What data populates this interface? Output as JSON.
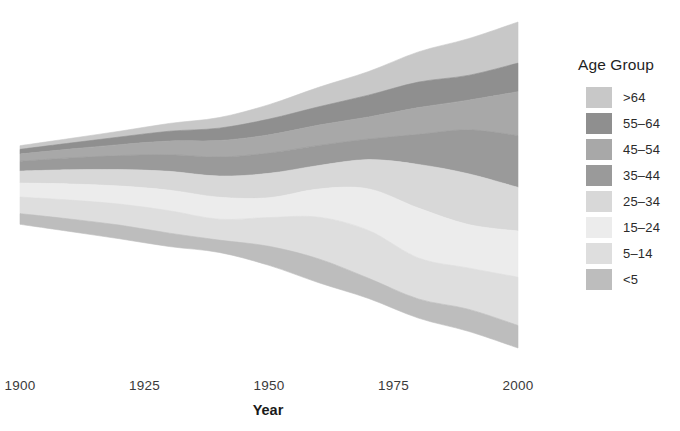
{
  "chart_data": {
    "type": "area",
    "variant": "streamgraph",
    "title": "",
    "xlabel": "Year",
    "ylabel": "",
    "xlim": [
      1900,
      2000
    ],
    "xticks": [
      1900,
      1925,
      1950,
      1975,
      2000
    ],
    "xtick_labels": [
      "1900",
      "1925",
      "1950",
      "1975",
      "2000"
    ],
    "grid": false,
    "legend_title": "Age Group",
    "legend_position": "right",
    "stack_order": "inside-out",
    "stack_offset": "wiggle",
    "x": [
      1900,
      1910,
      1920,
      1930,
      1940,
      1950,
      1960,
      1970,
      1980,
      1990,
      2000
    ],
    "series": [
      {
        "name": ">64",
        "color": "#c8c8c8",
        "values": [
          3.1,
          3.9,
          4.9,
          6.6,
          9.0,
          12.3,
          16.6,
          20.1,
          25.7,
          31.2,
          35.0
        ]
      },
      {
        "name": "55-64",
        "color": "#8f8f8f",
        "values": [
          4.0,
          5.1,
          6.5,
          8.4,
          10.6,
          13.4,
          15.6,
          18.6,
          21.7,
          21.1,
          24.3
        ]
      },
      {
        "name": "45-54",
        "color": "#a8a8a8",
        "values": [
          6.1,
          7.5,
          9.3,
          11.6,
          14.0,
          15.5,
          17.3,
          18.7,
          22.8,
          25.2,
          37.4
        ]
      },
      {
        "name": "35-44",
        "color": "#9a9a9a",
        "values": [
          8.4,
          10.1,
          11.9,
          14.2,
          16.2,
          17.3,
          17.1,
          17.6,
          25.6,
          37.4,
          44.1
        ]
      },
      {
        "name": "25-34",
        "color": "#d8d8d8",
        "values": [
          10.2,
          12.1,
          14.0,
          16.0,
          18.0,
          20.8,
          20.0,
          24.9,
          37.1,
          43.2,
          37.2
        ]
      },
      {
        "name": "15-24",
        "color": "#ececec",
        "values": [
          11.9,
          13.7,
          15.4,
          17.5,
          18.7,
          16.8,
          24.0,
          35.4,
          42.5,
          37.0,
          39.2
        ]
      },
      {
        "name": "5-14",
        "color": "#dedede",
        "values": [
          14.1,
          16.1,
          17.9,
          19.1,
          17.8,
          24.5,
          35.5,
          40.7,
          34.9,
          35.1,
          41.1
        ]
      },
      {
        "name": "<5",
        "color": "#bdbdbd",
        "values": [
          9.1,
          10.6,
          11.6,
          11.4,
          10.5,
          16.2,
          20.3,
          17.2,
          16.3,
          18.8,
          19.2
        ]
      }
    ]
  },
  "axis": {
    "title": "Year",
    "ticks": [
      {
        "label": "1900",
        "value": 1900
      },
      {
        "label": "1925",
        "value": 1925
      },
      {
        "label": "1950",
        "value": 1950
      },
      {
        "label": "1975",
        "value": 1975
      },
      {
        "label": "2000",
        "value": 2000
      }
    ]
  },
  "legend": {
    "title": "Age Group",
    "items": [
      {
        "label": ">64",
        "color": "#c8c8c8"
      },
      {
        "label": "55–64",
        "color": "#8f8f8f"
      },
      {
        "label": "45–54",
        "color": "#a8a8a8"
      },
      {
        "label": "35–44",
        "color": "#9a9a9a"
      },
      {
        "label": "25–34",
        "color": "#d8d8d8"
      },
      {
        "label": "15–24",
        "color": "#ececec"
      },
      {
        "label": "5–14",
        "color": "#dedede"
      },
      {
        "label": "<5",
        "color": "#bdbdbd"
      }
    ]
  }
}
